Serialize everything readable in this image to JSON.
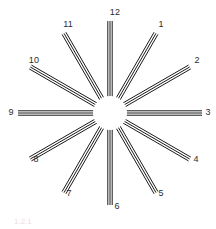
{
  "figure": {
    "background_color": "#ffffff",
    "stroke_color": "#1a1a1a",
    "hub_fill_color": "#ffffff",
    "label_color": "#2b2b2b",
    "caption_color": "#e8bdbd",
    "caption": "1.2.1",
    "center": {
      "x": 110,
      "y": 113
    },
    "hub_radius": 17,
    "spoke_inner_radius": 17,
    "spoke_outer_radius": 92,
    "lines_per_spoke": 3,
    "line_width": 1,
    "line_gap": 2.2,
    "spoke_count": 12,
    "label_radius": 101
  },
  "chart_data": {
    "type": "scatter",
    "title": "",
    "subtitle": "",
    "xlabel": "",
    "ylabel": "",
    "grid": false,
    "legend": "none",
    "categories": [
      "1",
      "2",
      "3",
      "4",
      "5",
      "6",
      "7",
      "8",
      "9",
      "10",
      "11",
      "12"
    ],
    "values": [
      30,
      60,
      90,
      120,
      150,
      180,
      210,
      240,
      270,
      300,
      330,
      0
    ],
    "series": [
      {
        "name": "spoke-angle-degrees-clockwise-from-up",
        "values": [
          30,
          60,
          90,
          120,
          150,
          180,
          210,
          240,
          270,
          300,
          330,
          0
        ]
      }
    ]
  },
  "spokes": [
    {
      "label": "1",
      "angle_deg": 30,
      "label_x": 161,
      "label_y": 24
    },
    {
      "label": "2",
      "angle_deg": 60,
      "label_x": 197,
      "label_y": 60
    },
    {
      "label": "3",
      "angle_deg": 90,
      "label_x": 208,
      "label_y": 112
    },
    {
      "label": "4",
      "angle_deg": 120,
      "label_x": 196,
      "label_y": 159
    },
    {
      "label": "5",
      "angle_deg": 150,
      "label_x": 161,
      "label_y": 193
    },
    {
      "label": "6",
      "angle_deg": 180,
      "label_x": 117,
      "label_y": 206
    },
    {
      "label": "7",
      "angle_deg": 210,
      "label_x": 69,
      "label_y": 193
    },
    {
      "label": "8",
      "angle_deg": 240,
      "label_x": 36,
      "label_y": 159
    },
    {
      "label": "9",
      "angle_deg": 270,
      "label_x": 11,
      "label_y": 112
    },
    {
      "label": "10",
      "angle_deg": 300,
      "label_x": 34,
      "label_y": 60
    },
    {
      "label": "11",
      "angle_deg": 330,
      "label_x": 68,
      "label_y": 24
    },
    {
      "label": "12",
      "angle_deg": 0,
      "label_x": 115,
      "label_y": 12
    }
  ]
}
